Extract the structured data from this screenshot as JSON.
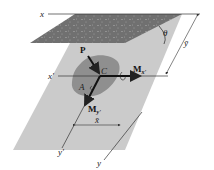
{
  "diagram": {
    "type": "hydrostatic force on inclined submerged plane surface",
    "colors": {
      "free_surface": "#6f6f6f",
      "plate": "#c8c8c8",
      "area": "#8e8e8e",
      "lines": "#333333",
      "background": "#ffffff"
    },
    "labels": {
      "free_surface_axis": "x",
      "angle": "θ",
      "y_bar": "ȳ",
      "x_bar": "x̄",
      "x_prime": "x'",
      "y_prime": "y'",
      "y": "y",
      "force": "P",
      "centroid": "C",
      "area": "A",
      "moment_x_main": "M",
      "moment_x_sub": "x'",
      "moment_y_main": "M",
      "moment_y_sub": "y'"
    }
  }
}
